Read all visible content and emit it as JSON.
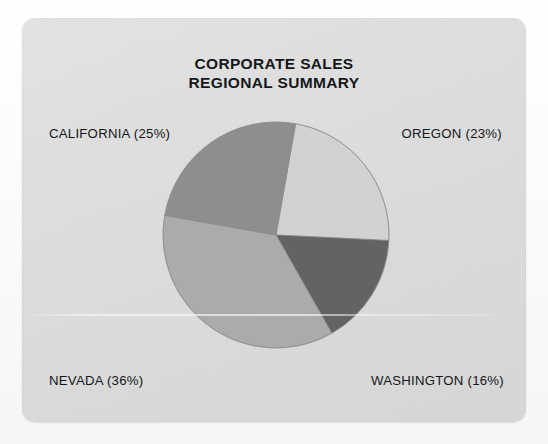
{
  "chart_data": {
    "type": "pie",
    "title": "CORPORATE SALES REGIONAL SUMMARY",
    "title_lines": [
      "CORPORATE SALES",
      "REGIONAL SUMMARY"
    ],
    "xlabel": "",
    "ylabel": "",
    "legend_position": "around-slices",
    "grid": false,
    "units": "percent",
    "categories": [
      "OREGON",
      "WASHINGTON",
      "NEVADA",
      "CALIFORNIA"
    ],
    "values": [
      23,
      16,
      36,
      25
    ],
    "labels": [
      "OREGON (23%)",
      "WASHINGTON (16%)",
      "NEVADA (36%)",
      "CALIFORNIA (25%)"
    ],
    "start_angle_deg": 10,
    "direction": "clockwise",
    "slices": [
      {
        "name": "OREGON",
        "label": "OREGON (23%)",
        "value": 23,
        "color": "#d2d2d2",
        "start_angle_deg": 10.0,
        "end_angle_deg": 92.8,
        "sweep_deg": 82.8,
        "position": "upper-right"
      },
      {
        "name": "WASHINGTON",
        "label": "WASHINGTON (16%)",
        "value": 16,
        "color": "#636363",
        "start_angle_deg": 92.8,
        "end_angle_deg": 150.4,
        "sweep_deg": 57.6,
        "position": "lower-right"
      },
      {
        "name": "NEVADA",
        "label": "NEVADA (36%)",
        "value": 36,
        "color": "#ababab",
        "start_angle_deg": 150.4,
        "end_angle_deg": 280.0,
        "sweep_deg": 129.6,
        "position": "lower-left"
      },
      {
        "name": "CALIFORNIA",
        "label": "CALIFORNIA (25%)",
        "value": 25,
        "color": "#8e8e8e",
        "start_angle_deg": 280.0,
        "end_angle_deg": 370.0,
        "sweep_deg": 90.0,
        "position": "upper-left"
      }
    ],
    "geometry": {
      "center_x": 254,
      "center_y": 217,
      "radius": 113
    },
    "colors": {
      "background": "#dedede",
      "text": "#14171a",
      "outline": "#8a8a8a"
    }
  }
}
